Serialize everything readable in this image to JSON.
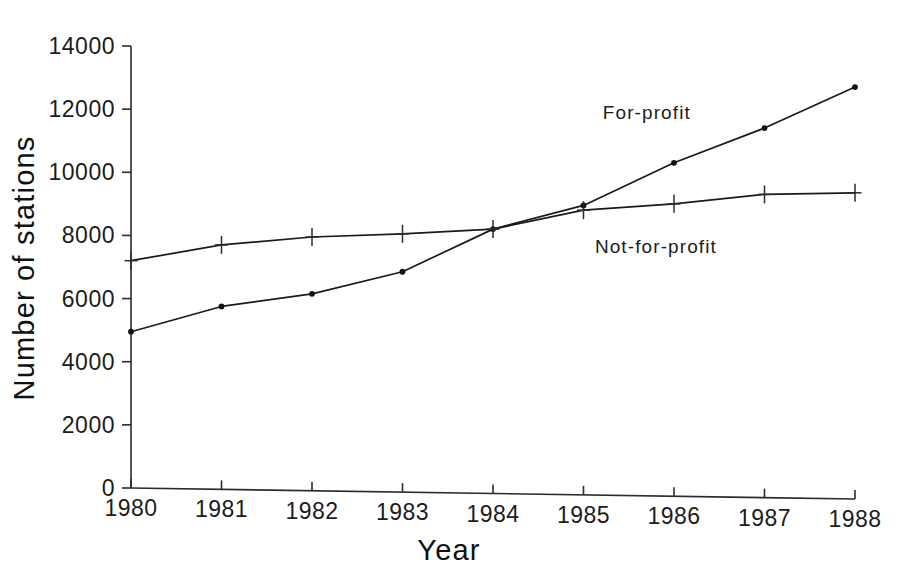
{
  "chart_data": {
    "type": "line",
    "title": "",
    "xlabel": "Year",
    "ylabel": "Number of stations",
    "x": [
      1980,
      1981,
      1982,
      1983,
      1984,
      1985,
      1986,
      1987,
      1988
    ],
    "categories": [
      "1980",
      "1981",
      "1982",
      "1983",
      "1984",
      "1985",
      "1986",
      "1987",
      "1988"
    ],
    "xlim": [
      1980,
      1988
    ],
    "ylim": [
      0,
      14000
    ],
    "ytick_values": [
      0,
      2000,
      4000,
      6000,
      8000,
      10000,
      12000,
      14000
    ],
    "ytick_labels": [
      "0",
      "2000",
      "4000",
      "6000",
      "8000",
      "10000",
      "12000",
      "14000"
    ],
    "grid": false,
    "legend_position": "inline-annotations",
    "series": [
      {
        "name": "For-profit",
        "marker": "dot",
        "color": "#1a1a1a",
        "values": [
          4950,
          5750,
          6150,
          6850,
          8200,
          8950,
          10300,
          11400,
          12700
        ],
        "label_x": 1985.7,
        "label_y": 11700
      },
      {
        "name": "Not-for-profit",
        "marker": "plus",
        "color": "#2b2b2b",
        "values": [
          7200,
          7700,
          7950,
          8050,
          8200,
          8800,
          9000,
          9300,
          9350
        ],
        "label_x": 1985.8,
        "label_y": 7450
      }
    ]
  },
  "axes": {
    "y_title": "Number of stations",
    "x_title": "Year"
  },
  "annotations": {
    "for_profit_label": "For-profit",
    "not_for_profit_label": "Not-for-profit"
  }
}
